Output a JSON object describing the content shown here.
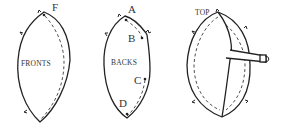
{
  "diagram": {
    "pieces": [
      {
        "id": "fronts",
        "label": "FRONTS",
        "points": [
          {
            "label": "F"
          }
        ]
      },
      {
        "id": "backs",
        "label": "BACKS",
        "points": [
          {
            "label": "A"
          },
          {
            "label": "B"
          },
          {
            "label": "C"
          },
          {
            "label": "D"
          }
        ]
      },
      {
        "id": "assembled",
        "label": "TOP"
      }
    ],
    "colors": {
      "stroke": "#222222",
      "text": "#333333",
      "background": "#ffffff"
    }
  }
}
